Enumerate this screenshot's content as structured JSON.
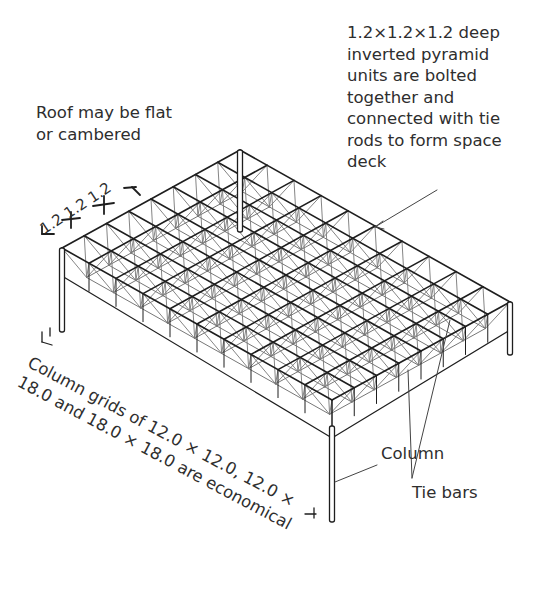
{
  "diagram": {
    "labels": {
      "units": [
        "1.2×1.2×1.2 deep",
        "inverted pyramid",
        "units are bolted",
        "together and",
        "connected with tie",
        "rods to form space",
        "deck"
      ],
      "roof": [
        "Roof may be flat",
        "or cambered"
      ],
      "dimensions": "1.2 1.2 1.2",
      "grids": [
        "Column grids of 12.0 × 12.0, 12.0 ×",
        "18.0 and 18.0 × 18.0 are economical"
      ],
      "tie_bars": "Tie bars",
      "column": "Column"
    },
    "grid": {
      "rows": 8,
      "cols": 10
    },
    "line_color": "#1e1e1e",
    "light_line_color": "#777777"
  }
}
